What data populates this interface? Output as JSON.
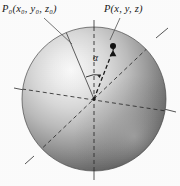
{
  "figure": {
    "background_color": "#fdfdfd"
  },
  "labels": {
    "point_p0": "P₀(x₀, y₀, z₀)",
    "point_p": "P(x, y, z)",
    "angle": "α"
  },
  "sphere": {
    "center_x": 94,
    "center_y": 99,
    "radius_x": 72,
    "radius_y": 72,
    "highlight_color": "#f2f2f2",
    "midtone_color": "#b3b3b3",
    "shadow_color": "#585858",
    "edge_color": "#3c3c3c"
  },
  "geometry": {
    "axis_color": "#2b2b2b",
    "leader_color": "#4a4a4a",
    "point_marker_color": "#111111",
    "point_p_x": 113,
    "point_p_y": 47,
    "axes": [
      {
        "name": "vertical-axis",
        "style": "dashed-inside-solid-outside"
      },
      {
        "name": "horizontal-axis",
        "style": "dashed"
      },
      {
        "name": "depth-axis",
        "style": "dashed"
      },
      {
        "name": "radius-to-p0",
        "style": "dashed"
      },
      {
        "name": "radius-to-p",
        "style": "dashed"
      }
    ]
  }
}
